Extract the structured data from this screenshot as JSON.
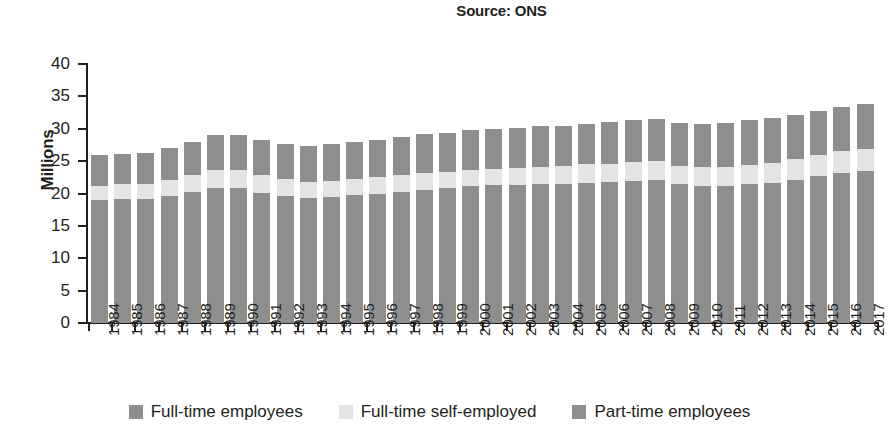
{
  "source_note": "Source: ONS",
  "axis": {
    "y_title": "Millions",
    "y_ticks": [
      "40",
      "35",
      "30",
      "25",
      "20",
      "15",
      "10",
      "5",
      "0"
    ]
  },
  "legend": {
    "items": [
      {
        "label": "Full-time employees",
        "color": "#8e8e8e",
        "icon": "legend-swatch-square"
      },
      {
        "label": "Full-time self-employed",
        "color": "#e4e4e4",
        "icon": "legend-swatch-square"
      },
      {
        "label": "Part-time employees",
        "color": "#8e8e8e",
        "icon": "legend-swatch-square"
      }
    ]
  },
  "colors": {
    "full_time_employees": "#8e8e8e",
    "full_time_self_employed": "#e4e4e4",
    "part_time_employees": "#8e8e8e",
    "axis": "#231f20",
    "background": "#ffffff"
  },
  "chart_data": {
    "type": "bar",
    "stacked": true,
    "title": "Source: ONS",
    "xlabel": "",
    "ylabel": "Millions",
    "ylim": [
      0,
      40
    ],
    "ytick_step": 5,
    "grid": false,
    "legend_position": "bottom",
    "units": "millions of people",
    "categories": [
      "1984",
      "1985",
      "1986",
      "1987",
      "1988",
      "1989",
      "1990",
      "1991",
      "1992",
      "1993",
      "1994",
      "1995",
      "1996",
      "1997",
      "1998",
      "1999",
      "2000",
      "2001",
      "2002",
      "2003",
      "2004",
      "2005",
      "2006",
      "2007",
      "2008",
      "2009",
      "2010",
      "2011",
      "2012",
      "2013",
      "2014",
      "2015",
      "2016",
      "2017"
    ],
    "series": [
      {
        "name": "Full-time employees",
        "color": "#8e8e8e",
        "values": [
          19.0,
          19.1,
          19.1,
          19.6,
          20.3,
          20.8,
          20.9,
          20.1,
          19.6,
          19.3,
          19.4,
          19.7,
          19.9,
          20.3,
          20.6,
          20.8,
          21.1,
          21.3,
          21.3,
          21.4,
          21.5,
          21.7,
          21.8,
          22.0,
          22.1,
          21.4,
          21.2,
          21.2,
          21.4,
          21.6,
          22.1,
          22.7,
          23.2,
          23.5
        ]
      },
      {
        "name": "Full-time self-employed",
        "color": "#e4e4e4",
        "values": [
          2.2,
          2.3,
          2.4,
          2.5,
          2.6,
          2.8,
          2.8,
          2.7,
          2.6,
          2.5,
          2.6,
          2.6,
          2.6,
          2.6,
          2.6,
          2.5,
          2.5,
          2.5,
          2.6,
          2.7,
          2.7,
          2.8,
          2.8,
          2.9,
          2.9,
          2.9,
          2.9,
          2.9,
          3.0,
          3.1,
          3.2,
          3.2,
          3.3,
          3.4
        ]
      },
      {
        "name": "Part-time employees",
        "color": "#8e8e8e",
        "values": [
          4.8,
          4.7,
          4.8,
          4.9,
          5.1,
          5.4,
          5.4,
          5.4,
          5.4,
          5.5,
          5.6,
          5.7,
          5.8,
          5.9,
          6.0,
          6.1,
          6.2,
          6.1,
          6.2,
          6.3,
          6.3,
          6.3,
          6.4,
          6.5,
          6.5,
          6.6,
          6.7,
          6.8,
          6.9,
          6.9,
          6.9,
          6.9,
          6.9,
          7.0
        ]
      }
    ],
    "totals": [
      26.0,
      26.1,
      26.3,
      27.0,
      28.0,
      29.0,
      29.1,
      28.2,
      27.6,
      27.3,
      27.6,
      28.0,
      28.3,
      28.8,
      29.2,
      29.4,
      29.8,
      29.9,
      30.1,
      30.4,
      30.5,
      30.8,
      31.0,
      31.4,
      31.5,
      30.9,
      30.8,
      30.9,
      31.3,
      31.6,
      32.2,
      32.8,
      33.4,
      33.9
    ]
  }
}
